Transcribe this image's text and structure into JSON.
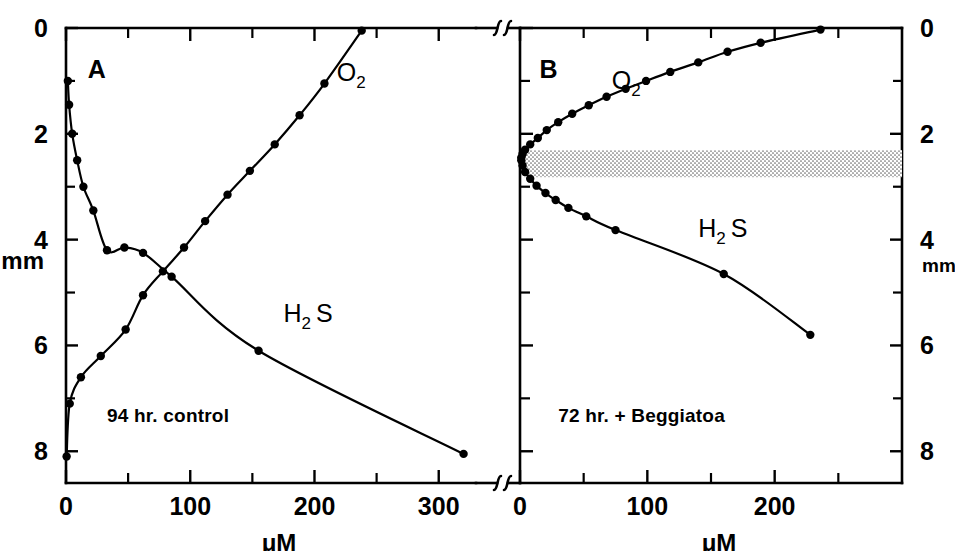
{
  "figure": {
    "axis_titles": {
      "x": "μM",
      "y": "mm"
    },
    "break_symbol": "axis-break"
  },
  "chart_data": [
    {
      "type": "line",
      "panel": "A",
      "title": "A",
      "annotation": "94 hr. control",
      "xlabel": "μM",
      "ylabel": "mm",
      "xlim": [
        0,
        330
      ],
      "ylim": [
        0,
        8.6
      ],
      "y_inverted": true,
      "grid": false,
      "xticks": [
        0,
        50,
        100,
        150,
        200,
        250,
        300
      ],
      "xtick_labels": [
        "0",
        "",
        "100",
        "",
        "200",
        "",
        "300"
      ],
      "yticks": [
        0,
        1,
        2,
        3,
        4,
        5,
        6,
        7,
        8
      ],
      "ytick_labels": [
        "0",
        "",
        "2",
        "",
        "4",
        "",
        "6",
        "",
        "8"
      ],
      "series": [
        {
          "name": "O2",
          "label": "O",
          "sub": "2",
          "label_pos": {
            "x": 218,
            "y": 1.0
          },
          "x": [
            0.5,
            3,
            12,
            28,
            48,
            62,
            78,
            95,
            112,
            130,
            148,
            168,
            188,
            208,
            238
          ],
          "y": [
            8.1,
            7.1,
            6.6,
            6.2,
            5.7,
            5.05,
            4.6,
            4.15,
            3.65,
            3.15,
            2.7,
            2.2,
            1.65,
            1.05,
            0.05
          ]
        },
        {
          "name": "H2S",
          "label": "H",
          "sub": "2",
          "label2": "S",
          "label_pos": {
            "x": 175,
            "y": 5.55
          },
          "x": [
            1.5,
            2.5,
            5,
            9,
            14,
            22,
            33,
            47,
            62,
            85,
            155,
            320
          ],
          "y": [
            1.0,
            1.45,
            2.0,
            2.5,
            3.0,
            3.45,
            4.2,
            4.15,
            4.25,
            4.7,
            6.1,
            8.05
          ]
        }
      ]
    },
    {
      "type": "line",
      "panel": "B",
      "title": "B",
      "annotation": "72 hr. + Beggiatoa",
      "xlabel": "μM",
      "ylabel": "mm",
      "xlim": [
        0,
        300
      ],
      "ylim": [
        0,
        8.6
      ],
      "y_inverted": true,
      "grid": false,
      "xticks": [
        0,
        50,
        100,
        150,
        200,
        250
      ],
      "xtick_labels": [
        "0",
        "",
        "100",
        "",
        "200",
        ""
      ],
      "yticks": [
        0,
        1,
        2,
        3,
        4,
        5,
        6,
        7,
        8
      ],
      "ytick_labels": [
        "0",
        "",
        "2",
        "",
        "4",
        "",
        "6",
        "",
        "8"
      ],
      "shaded_band": {
        "y_top": 2.31,
        "y_bottom": 2.82,
        "x_start": 3,
        "x_end": 300,
        "style": "stipple"
      },
      "series": [
        {
          "name": "O2",
          "label": "O",
          "sub": "2",
          "label_pos": {
            "x": 72,
            "y": 1.15
          },
          "x": [
            1,
            2,
            4,
            8,
            14,
            21,
            30,
            41,
            54,
            68,
            83,
            99,
            118,
            140,
            163,
            189,
            236
          ],
          "y": [
            2.45,
            2.38,
            2.3,
            2.2,
            2.08,
            1.93,
            1.78,
            1.62,
            1.46,
            1.3,
            1.15,
            1.0,
            0.83,
            0.65,
            0.45,
            0.28,
            0.03
          ]
        },
        {
          "name": "H2S",
          "label": "H",
          "sub": "2",
          "label2": "S",
          "label_pos": {
            "x": 140,
            "y": 3.95
          },
          "x": [
            1,
            2,
            4,
            8,
            13,
            20,
            28,
            38,
            52,
            75,
            160,
            228
          ],
          "y": [
            2.5,
            2.6,
            2.72,
            2.85,
            2.98,
            3.12,
            3.25,
            3.4,
            3.56,
            3.82,
            4.65,
            5.8
          ]
        }
      ]
    }
  ]
}
